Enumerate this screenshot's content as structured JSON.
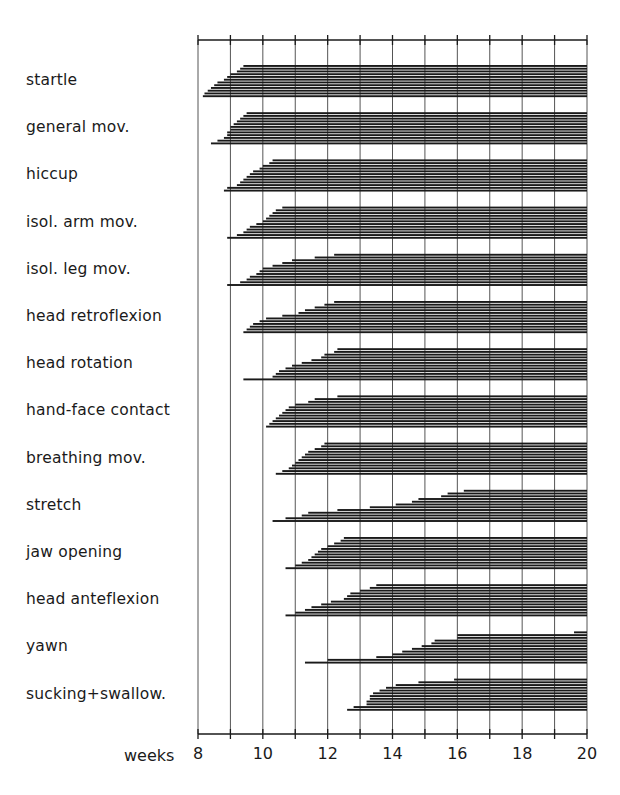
{
  "chart_data": {
    "type": "bar",
    "subtype": "horizontal-onset-range",
    "title": "",
    "xlabel": "weeks",
    "ylabel": "",
    "xlim": [
      8,
      20
    ],
    "x_ticks": [
      8,
      9,
      10,
      11,
      12,
      13,
      14,
      15,
      16,
      17,
      18,
      19,
      20
    ],
    "x_tick_labels": [
      "8",
      "10",
      "12",
      "14",
      "16",
      "18",
      "20"
    ],
    "grid": true,
    "legend": null,
    "bars_per_category": 12,
    "bar_end": 20,
    "categories": [
      "startle",
      "general mov.",
      "hiccup",
      "isol. arm mov.",
      "isol. leg mov.",
      "head retroflexion",
      "head rotation",
      "hand-face contact",
      "breathing mov.",
      "stretch",
      "jaw opening",
      "head anteflexion",
      "yawn",
      "sucking+swallow."
    ],
    "series": [
      {
        "name": "startle",
        "onsets": [
          9.4,
          9.3,
          9.2,
          9.0,
          8.9,
          8.8,
          8.6,
          8.5,
          8.4,
          8.3,
          8.2,
          8.15
        ]
      },
      {
        "name": "general mov.",
        "onsets": [
          9.5,
          9.4,
          9.3,
          9.2,
          9.1,
          9.0,
          9.0,
          8.9,
          8.9,
          8.8,
          8.6,
          8.4
        ]
      },
      {
        "name": "hiccup",
        "onsets": [
          10.3,
          10.2,
          10.0,
          9.9,
          9.7,
          9.6,
          9.5,
          9.4,
          9.3,
          9.2,
          8.9,
          8.8
        ]
      },
      {
        "name": "isol. arm mov.",
        "onsets": [
          10.6,
          10.4,
          10.3,
          10.2,
          10.1,
          10.0,
          9.8,
          9.6,
          9.5,
          9.4,
          9.2,
          8.9
        ]
      },
      {
        "name": "isol. leg mov.",
        "onsets": [
          12.2,
          11.6,
          10.9,
          10.6,
          10.3,
          10.0,
          9.9,
          9.8,
          9.6,
          9.5,
          9.3,
          8.9
        ]
      },
      {
        "name": "head retroflexion",
        "onsets": [
          12.2,
          11.9,
          11.6,
          11.3,
          11.1,
          10.6,
          10.1,
          9.9,
          9.7,
          9.6,
          9.5,
          9.4
        ]
      },
      {
        "name": "head rotation",
        "onsets": [
          12.3,
          12.2,
          11.9,
          11.8,
          11.5,
          11.2,
          10.9,
          10.7,
          10.5,
          10.4,
          10.3,
          9.4
        ]
      },
      {
        "name": "hand-face contact",
        "onsets": [
          12.3,
          11.6,
          11.4,
          11.0,
          10.8,
          10.7,
          10.6,
          10.5,
          10.4,
          10.3,
          10.2,
          10.1
        ]
      },
      {
        "name": "breathing mov.",
        "onsets": [
          11.9,
          11.8,
          11.6,
          11.4,
          11.3,
          11.2,
          11.1,
          11.0,
          10.9,
          10.8,
          10.6,
          10.4
        ]
      },
      {
        "name": "stretch",
        "onsets": [
          16.2,
          15.7,
          15.5,
          14.8,
          14.6,
          14.1,
          13.3,
          12.3,
          11.4,
          11.2,
          10.7,
          10.3
        ]
      },
      {
        "name": "jaw opening",
        "onsets": [
          12.5,
          12.4,
          12.2,
          12.0,
          11.8,
          11.7,
          11.6,
          11.5,
          11.4,
          11.2,
          11.0,
          10.7
        ]
      },
      {
        "name": "head anteflexion",
        "onsets": [
          13.5,
          13.3,
          13.0,
          12.7,
          12.6,
          12.5,
          12.1,
          11.8,
          11.5,
          11.3,
          11.0,
          10.7
        ]
      },
      {
        "name": "yawn",
        "onsets": [
          19.6,
          16.0,
          16.0,
          15.3,
          15.2,
          14.9,
          14.6,
          14.3,
          14.0,
          13.5,
          12.0,
          11.3
        ]
      },
      {
        "name": "sucking+swallow.",
        "onsets": [
          15.9,
          14.8,
          14.1,
          13.8,
          13.6,
          13.4,
          13.3,
          13.3,
          13.2,
          13.2,
          12.8,
          12.6
        ]
      }
    ]
  },
  "colors": {
    "ink": "#1a1a1a",
    "grid": "#555555",
    "background": "#ffffff"
  }
}
